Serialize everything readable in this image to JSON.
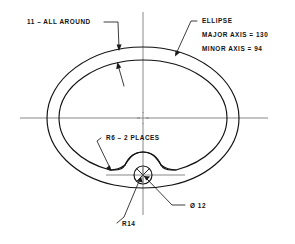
{
  "drawing": {
    "title": "Ellipse profile with keyway notch — dimensioned engineering drawing",
    "background_color": "#ffffff",
    "line_color": "#111111",
    "centerline_color": "#7a7a7a",
    "annotations": {
      "surface_finish": {
        "label": "11 – ALL AROUND",
        "name": "surface-finish-note"
      },
      "ellipse_note": {
        "line1": "ELLIPSE",
        "line2": "MAJOR AXIS = 130",
        "line3": "MINOR  AXIS =  94"
      },
      "fillet_note": {
        "label": "R6 –   2 PLACES"
      },
      "hole_note": {
        "label": "Ø 12"
      },
      "radius_note": {
        "label": "R14"
      }
    },
    "dimensions": {
      "major_axis": 130,
      "minor_axis": 94,
      "fillet_radius": 6,
      "fillet_count": 2,
      "hole_diameter": 12,
      "notch_radius": 14,
      "surface_finish_value": 11
    },
    "geometry": {
      "center_x": 143,
      "center_y": 118,
      "outer_ellipse_rx": 96,
      "outer_ellipse_ry": 71,
      "inner_ellipse_rx": 84,
      "inner_ellipse_ry": 58,
      "hole_center_x": 143,
      "hole_center_y": 175,
      "hole_radius": 9
    }
  }
}
